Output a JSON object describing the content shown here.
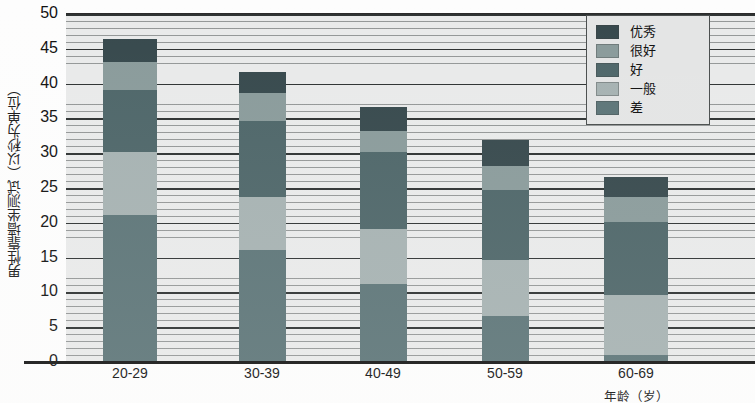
{
  "chart_data": {
    "type": "bar",
    "subtype": "stacked",
    "title": "",
    "xlabel": "年龄（岁）",
    "ylabel": "男性靠墙坐测试（以秒为单位）",
    "categories": [
      "20-29",
      "30-39",
      "40-49",
      "50-59",
      "60-69"
    ],
    "ylim": [
      0,
      50
    ],
    "ytick_step": 5,
    "yticks": [
      50,
      45,
      40,
      35,
      30,
      25,
      20,
      15,
      10,
      5,
      0
    ],
    "ytick_labels": [
      "50",
      "45",
      "40",
      "35",
      "30",
      "25",
      "20",
      "15",
      "10",
      "5",
      "0"
    ],
    "grid": "horizontal-minor-and-major",
    "legend_position": "top-right",
    "series": [
      {
        "name": "优秀",
        "values": [
          46.2,
          41.5,
          36.5,
          31.8,
          26.5
        ]
      },
      {
        "name": "很好",
        "values": [
          43.0,
          38.5,
          33.0,
          28.0,
          23.5
        ]
      },
      {
        "name": "好",
        "values": [
          39.0,
          34.5,
          30.0,
          24.5,
          20.0
        ]
      },
      {
        "name": "一般",
        "values": [
          30.0,
          23.5,
          19.0,
          14.5,
          9.5
        ]
      },
      {
        "name": "差",
        "values": [
          21.0,
          16.0,
          11.0,
          6.5,
          0.8
        ]
      }
    ],
    "segments": [
      {
        "category": "20-29",
        "stack": [
          {
            "label": "差",
            "from": 0.0,
            "to": 21.0
          },
          {
            "label": "一般",
            "from": 21.0,
            "to": 30.0
          },
          {
            "label": "好",
            "from": 30.0,
            "to": 39.0
          },
          {
            "label": "很好",
            "from": 39.0,
            "to": 43.0
          },
          {
            "label": "优秀",
            "from": 43.0,
            "to": 46.2
          }
        ]
      },
      {
        "category": "30-39",
        "stack": [
          {
            "label": "差",
            "from": 0.0,
            "to": 16.0
          },
          {
            "label": "一般",
            "from": 16.0,
            "to": 23.5
          },
          {
            "label": "好",
            "from": 23.5,
            "to": 34.5
          },
          {
            "label": "很好",
            "from": 34.5,
            "to": 38.5
          },
          {
            "label": "优秀",
            "from": 38.5,
            "to": 41.5
          }
        ]
      },
      {
        "category": "40-49",
        "stack": [
          {
            "label": "差",
            "from": 0.0,
            "to": 11.0
          },
          {
            "label": "一般",
            "from": 11.0,
            "to": 19.0
          },
          {
            "label": "好",
            "from": 19.0,
            "to": 30.0
          },
          {
            "label": "很好",
            "from": 30.0,
            "to": 33.0
          },
          {
            "label": "优秀",
            "from": 33.0,
            "to": 36.5
          }
        ]
      },
      {
        "category": "50-59",
        "stack": [
          {
            "label": "差",
            "from": 0.0,
            "to": 6.5
          },
          {
            "label": "一般",
            "from": 6.5,
            "to": 14.5
          },
          {
            "label": "好",
            "from": 14.5,
            "to": 24.5
          },
          {
            "label": "很好",
            "from": 24.5,
            "to": 28.0
          },
          {
            "label": "优秀",
            "from": 28.0,
            "to": 31.8
          }
        ]
      },
      {
        "category": "60-69",
        "stack": [
          {
            "label": "差",
            "from": 0.0,
            "to": 0.8
          },
          {
            "label": "一般",
            "from": 0.8,
            "to": 9.5
          },
          {
            "label": "好",
            "from": 9.5,
            "to": 20.0
          },
          {
            "label": "很好",
            "from": 20.0,
            "to": 23.5
          },
          {
            "label": "优秀",
            "from": 23.5,
            "to": 26.5
          }
        ]
      }
    ],
    "colors": {
      "优秀": "#37494d",
      "很好": "#8a9b9b",
      "好": "#4e6669",
      "一般": "#a6b2b2",
      "差": "#5d7578",
      "plot_background": "#e9eaea",
      "gridline": "#2e3232",
      "axis": "#141414",
      "legend_background": "#e4e5e5",
      "legend_border": "#4a4e4e",
      "text": "#111111"
    }
  },
  "legend": {
    "items": [
      {
        "label": "优秀",
        "color": "#37494d"
      },
      {
        "label": "很好",
        "color": "#8a9b9b"
      },
      {
        "label": "好",
        "color": "#4e6669"
      },
      {
        "label": "一般",
        "color": "#a6b2b2"
      },
      {
        "label": "差",
        "color": "#5d7578"
      }
    ]
  },
  "axes": {
    "y_title": "男性靠墙坐测试（以秒为单位）",
    "x_title": "年龄（岁）"
  },
  "bar_geometry": {
    "bar_x_centers": [
      130,
      262,
      383,
      505,
      636
    ],
    "bar_widths": [
      54,
      47,
      47,
      47,
      64
    ],
    "plot_left": 66,
    "plot_top": 13,
    "plot_width": 689,
    "plot_height": 348,
    "y_zero_px": 361,
    "px_per_unit": 6.96
  }
}
